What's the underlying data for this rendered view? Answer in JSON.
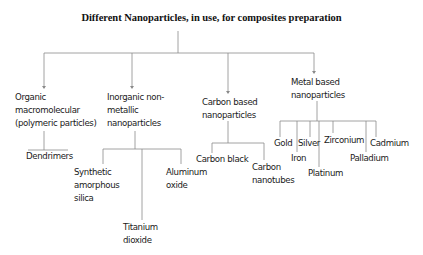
{
  "diagram": {
    "title": "Different Nanoparticles, in use, for composites preparation",
    "line_color": "#8a8a8a",
    "categories": [
      {
        "id": "organic",
        "label_lines": [
          "Organic",
          "macromolecular",
          "(polymeric particles)"
        ],
        "children": [
          "Dendrimers"
        ]
      },
      {
        "id": "inorganic",
        "label_lines": [
          "Inorganic non-",
          "metallic",
          "nanoparticles"
        ],
        "children": [
          {
            "label_lines": [
              "Synthetic",
              "amorphous",
              "silica"
            ]
          },
          {
            "label_lines": [
              "Titanium",
              "dioxide"
            ]
          },
          {
            "label_lines": [
              "Aluminum",
              "oxide"
            ]
          }
        ]
      },
      {
        "id": "carbon",
        "label_lines": [
          "Carbon based",
          "nanoparticles"
        ],
        "children": [
          {
            "label_lines": [
              "Carbon black"
            ]
          },
          {
            "label_lines": [
              "Carbon",
              "nanotubes"
            ]
          }
        ]
      },
      {
        "id": "metal",
        "label_lines": [
          "Metal based",
          "nanoparticles"
        ],
        "children": [
          "Gold",
          "Iron",
          "Silver",
          "Platinum",
          "Zirconium",
          "Palladium",
          "Cadmium"
        ]
      }
    ]
  }
}
